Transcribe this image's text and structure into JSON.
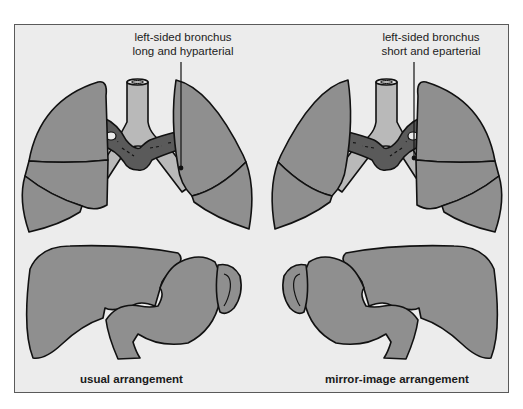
{
  "figure": {
    "left_panel": {
      "annotation_line1": "left-sided bronchus",
      "annotation_line2": "long and hyparterial",
      "caption": "usual arrangement"
    },
    "right_panel": {
      "annotation_line1": "left-sided bronchus",
      "annotation_line2": "short and eparterial",
      "caption": "mirror-image arrangement"
    },
    "colors": {
      "background": "#ececec",
      "organ_fill": "#8f8f8f",
      "trachea_fill": "#b9b9b9",
      "artery_fill": "#5a5a5a",
      "outline": "#111111"
    }
  }
}
